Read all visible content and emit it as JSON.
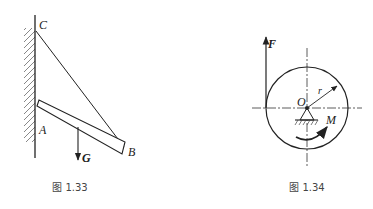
{
  "figures": [
    {
      "caption": "图 1.33",
      "labels": {
        "c": "C",
        "a": "A",
        "b": "B",
        "g": "G"
      }
    },
    {
      "caption": "图 1.34",
      "labels": {
        "f": "F",
        "o": "O",
        "r": "r",
        "m": "M"
      }
    }
  ]
}
